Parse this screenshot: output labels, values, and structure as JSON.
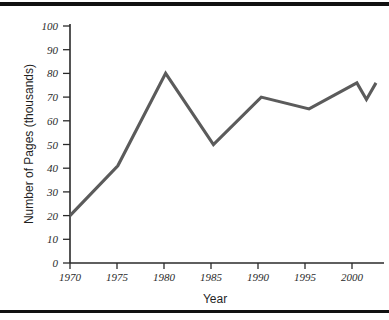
{
  "chart_data": {
    "type": "line",
    "title": "",
    "xlabel": "Year",
    "ylabel": "Number of Pages (thousands)",
    "x": [
      1970,
      1975,
      1980,
      1985,
      1990,
      1995,
      2000,
      2001,
      2002
    ],
    "values": [
      20,
      41,
      80,
      50,
      70,
      65,
      76,
      69,
      76
    ],
    "series": [
      {
        "name": "Number of Pages",
        "values": [
          20,
          41,
          80,
          50,
          70,
          65,
          76,
          69,
          76
        ]
      }
    ],
    "xlim": [
      1970,
      2002
    ],
    "ylim": [
      0,
      100
    ],
    "xticks": [
      1970,
      1975,
      1980,
      1985,
      1990,
      1995,
      2000
    ],
    "xtick_labels": [
      "1970",
      "1975",
      "1980",
      "1985",
      "1990",
      "1995",
      "2000"
    ],
    "yticks": [
      0,
      10,
      20,
      30,
      40,
      50,
      60,
      70,
      80,
      90,
      100
    ],
    "ytick_labels": [
      "0",
      "10",
      "20",
      "30",
      "40",
      "50",
      "60",
      "70",
      "80",
      "90",
      "100"
    ],
    "grid": false,
    "legend": false,
    "line_color": "#5b5b5b",
    "axis_color": "#2a2a2a"
  },
  "frame": {
    "top_rule": "",
    "bottom_rule": ""
  }
}
